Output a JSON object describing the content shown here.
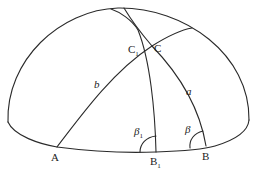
{
  "diagram": {
    "type": "spherical-triangle-hemisphere",
    "stroke_color": "#2a2a2a",
    "points": {
      "A": {
        "label": "A"
      },
      "B": {
        "label": "B"
      },
      "B1": {
        "label": "B",
        "sub": "1"
      },
      "C": {
        "label": "C"
      },
      "C1": {
        "label": "C",
        "sub": "1"
      }
    },
    "arcs": {
      "a": {
        "label": "a"
      },
      "b": {
        "label": "b"
      }
    },
    "angles": {
      "beta": {
        "label": "β"
      },
      "beta1": {
        "label": "β",
        "sub": "1"
      }
    }
  }
}
